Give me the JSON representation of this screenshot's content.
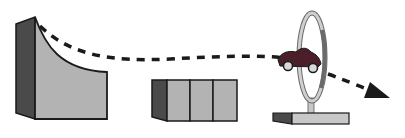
{
  "diagram": {
    "elements": [
      {
        "id": "ramp",
        "label": "curved ramp"
      },
      {
        "id": "blocks",
        "label": "row of three blocks"
      },
      {
        "id": "hoop",
        "label": "hoop on stand"
      },
      {
        "id": "car",
        "label": "toy car"
      },
      {
        "id": "trajectory",
        "label": "dashed trajectory arrow"
      }
    ],
    "colors": {
      "outline": "#1a1a1a",
      "dark_face": "#4a4a4a",
      "light_face": "#b3b3b3",
      "ring": "#c8c8c8",
      "car_body": "#4a1f2a",
      "car_wheel": "#d9d9d9",
      "arrow": "#1a1a1a"
    }
  }
}
